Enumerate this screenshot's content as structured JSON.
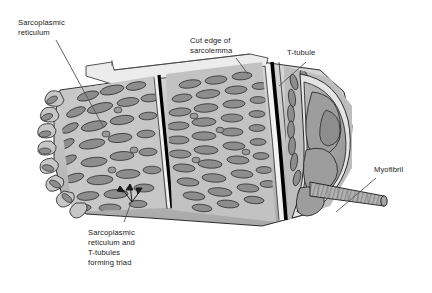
{
  "figure": {
    "background": "#ffffff"
  },
  "labels": {
    "sarcoplasmic_reticulum": "Sarcoplasmic\nreticulum",
    "cut_edge_of_sarcolemma": "Cut edge of\nsarcolemma",
    "t_tubule": "T-tubule",
    "myofibril": "Myofibril",
    "triad": "Sarcoplasmic\nreticulum and\nT-tubules\nforming triad"
  },
  "colors": {
    "outline": "#1a1a1a",
    "text": "#1a1a1a",
    "cytosol_light": "#c9c9c9",
    "cytosol_mid": "#b4b4b4",
    "sr_blob": "#8d8d8d",
    "sr_blob_dark": "#7a7a7a",
    "sarcolemma": "#e8e8e8",
    "t_tubule": "#000000",
    "myofibril_core": "#9a9a9a",
    "myofibril_rod": "#b0b0b0",
    "cross_section_fill": "#a8a8a8",
    "leader_line": "#555555"
  },
  "parts": [
    {
      "name": "sarcoplasmic-reticulum",
      "description": "Lacy membranous network sheathing the muscle fiber, drawn as many elongated gray blobs over a light ground"
    },
    {
      "name": "cut-edge-of-sarcolemma",
      "description": "Pale flap of plasma membrane peeled back along the top of the cylinder"
    },
    {
      "name": "t-tubule",
      "description": "Thick black circumferential band invaginating from the sarcolemma"
    },
    {
      "name": "triad",
      "description": "Junction of two terminal cisternae of SR with one T-tubule, marked by three arrows"
    },
    {
      "name": "myofibril",
      "description": "Striated cylindrical rod projecting from the cut cross-section at the right end"
    },
    {
      "name": "cross-section-face",
      "description": "Elliptical cut face of the fiber exposing myofibril bundles"
    }
  ],
  "annotations": {
    "triad_arrow_count": 3
  }
}
